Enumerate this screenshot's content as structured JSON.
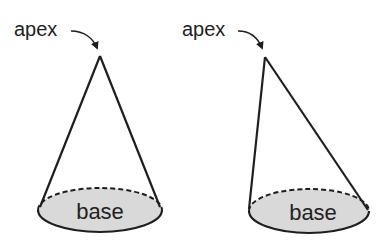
{
  "diagram": {
    "type": "cone-comparison",
    "colors": {
      "stroke": "#1e1e1e",
      "base_fill": "#d9d9d9",
      "text": "#222222",
      "background": "#ffffff"
    },
    "cones": [
      {
        "name": "right-cone",
        "apex_label": "apex",
        "base_label": "base"
      },
      {
        "name": "oblique-cone",
        "apex_label": "apex",
        "base_label": "base"
      }
    ]
  }
}
